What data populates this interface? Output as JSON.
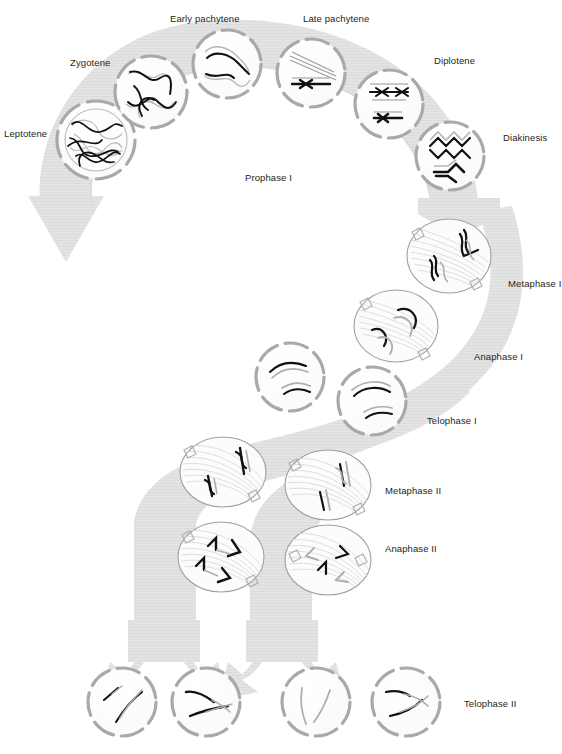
{
  "figure": {
    "title_visible": false,
    "background_color": "#ffffff",
    "flow_color": "#e2e2e2",
    "flow_shadow_color": "#d0d0d0",
    "membrane_color": "#a9a9a9",
    "chromosome_dark_color": "#1a1a1a",
    "chromosome_light_color": "#b3b3b3",
    "spindle_color": "#cfcfcf",
    "label_color": "#231f20"
  },
  "labels": {
    "leptotene": "Leptotene",
    "zygotene": "Zygotene",
    "early_pachytene": "Early pachytene",
    "late_pachytene": "Late pachytene",
    "diplotene": "Diplotene",
    "diakinesis": "Diakinesis",
    "prophase_1": "Prophase I",
    "metaphase_1": "Metaphase I",
    "anaphase_1": "Anaphase I",
    "telophase_1": "Telophase I",
    "metaphase_2": "Metaphase II",
    "anaphase_2": "Anaphase II",
    "telophase_2": "Telophase II"
  },
  "stages": [
    {
      "key": "leptotene",
      "label": "Leptotene",
      "cell_center": [
        96,
        140
      ],
      "cell_radius": 39,
      "label_pos": [
        4,
        128
      ],
      "cell_style": "dashed-ring-with-inner-nucleus"
    },
    {
      "key": "zygotene",
      "label": "Zygotene",
      "cell_center": [
        151,
        92
      ],
      "cell_radius": 36,
      "label_pos": [
        70,
        57
      ],
      "cell_style": "dashed-ring"
    },
    {
      "key": "early_pachytene",
      "label": "Early pachytene",
      "cell_center": [
        227,
        64
      ],
      "cell_radius": 34,
      "label_pos": [
        170,
        13
      ],
      "cell_style": "dashed-ring"
    },
    {
      "key": "late_pachytene",
      "label": "Late pachytene",
      "cell_center": [
        311,
        73
      ],
      "cell_radius": 34,
      "label_pos": [
        303,
        13
      ],
      "cell_style": "dashed-ring"
    },
    {
      "key": "diplotene",
      "label": "Diplotene",
      "cell_center": [
        389,
        104
      ],
      "cell_radius": 34,
      "label_pos": [
        434,
        55
      ],
      "cell_style": "dashed-ring"
    },
    {
      "key": "diakinesis",
      "label": "Diakinesis",
      "cell_center": [
        450,
        156
      ],
      "cell_radius": 34,
      "label_pos": [
        503,
        132
      ],
      "cell_style": "dashed-ring"
    },
    {
      "key": "metaphase_1",
      "label": "Metaphase I",
      "cell_center": [
        449,
        256
      ],
      "cell_radius": 40,
      "label_pos": [
        508,
        278
      ],
      "cell_style": "spindle-ellipse"
    },
    {
      "key": "anaphase_1",
      "label": "Anaphase I",
      "cell_center": [
        396,
        326
      ],
      "cell_radius": 38,
      "label_pos": [
        474,
        351
      ],
      "cell_style": "spindle-ellipse"
    },
    {
      "key": "telophase_1_a",
      "label": "",
      "cell_center": [
        290,
        377
      ],
      "cell_radius": 34,
      "label_pos": null,
      "cell_style": "dashed-ring"
    },
    {
      "key": "telophase_1_b",
      "label": "Telophase I",
      "cell_center": [
        372,
        401
      ],
      "cell_radius": 34,
      "label_pos": [
        427,
        415
      ],
      "cell_style": "dashed-ring"
    },
    {
      "key": "metaphase_2_a",
      "label": "",
      "cell_center": [
        223,
        472
      ],
      "cell_radius": 39,
      "label_pos": null,
      "cell_style": "spindle-ellipse"
    },
    {
      "key": "metaphase_2_b",
      "label": "Metaphase II",
      "cell_center": [
        328,
        485
      ],
      "cell_radius": 39,
      "label_pos": [
        385,
        485
      ],
      "cell_style": "spindle-ellipse"
    },
    {
      "key": "anaphase_2_a",
      "label": "",
      "cell_center": [
        221,
        557
      ],
      "cell_radius": 39,
      "label_pos": null,
      "cell_style": "spindle-ellipse"
    },
    {
      "key": "anaphase_2_b",
      "label": "Anaphase II",
      "cell_center": [
        328,
        560
      ],
      "cell_radius": 39,
      "label_pos": [
        385,
        543
      ],
      "cell_style": "spindle-ellipse"
    },
    {
      "key": "telophase_2_1",
      "label": "",
      "cell_center": [
        122,
        702
      ],
      "cell_radius": 34,
      "label_pos": null,
      "cell_style": "dashed-ring"
    },
    {
      "key": "telophase_2_2",
      "label": "",
      "cell_center": [
        206,
        702
      ],
      "cell_radius": 34,
      "label_pos": null,
      "cell_style": "dashed-ring"
    },
    {
      "key": "telophase_2_3",
      "label": "",
      "cell_center": [
        316,
        702
      ],
      "cell_radius": 34,
      "label_pos": null,
      "cell_style": "dashed-ring"
    },
    {
      "key": "telophase_2_4",
      "label": "Telophase II",
      "cell_center": [
        406,
        702
      ],
      "cell_radius": 34,
      "label_pos": [
        464,
        698
      ],
      "cell_style": "dashed-ring"
    }
  ],
  "flow": {
    "arc_description": "large gray arc sweeping left-to-right over prophase I cells ending in arrowhead at lower-left",
    "trunk_description": "wide gray band descending right-to-left through meiosis I and II",
    "arrow_count_bottom": 4
  }
}
